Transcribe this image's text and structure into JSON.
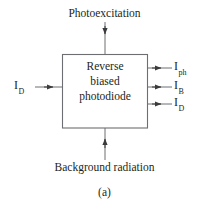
{
  "figure": {
    "caption": "(a)",
    "top_label": "Photoexcitation",
    "bottom_label": "Background radiation",
    "box": {
      "line1": "Reverse",
      "line2": "biased",
      "line3": "photodiode"
    },
    "inputs": {
      "left": {
        "symbol": "I",
        "subscript": "D"
      }
    },
    "outputs": [
      {
        "symbol": "I",
        "subscript": "ph"
      },
      {
        "symbol": "I",
        "subscript": "B"
      },
      {
        "symbol": "I",
        "subscript": "D"
      }
    ],
    "colors": {
      "stroke": "#6d6e71",
      "text": "#231f20",
      "background": "#ffffff"
    }
  }
}
